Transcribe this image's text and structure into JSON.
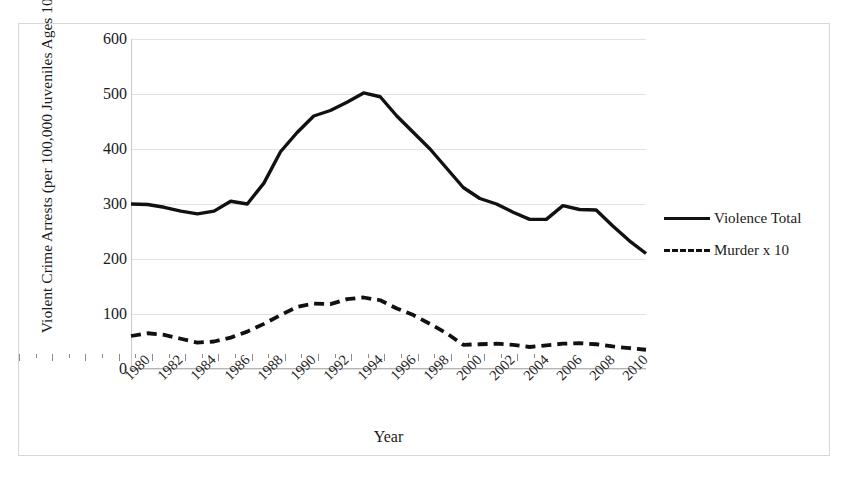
{
  "chart_data": {
    "type": "line",
    "title": "",
    "xlabel": "Year",
    "ylabel": "Violent Crime Arrests (per 100,000 Juveniles Ages 10–17)",
    "x": [
      1980,
      1981,
      1982,
      1983,
      1984,
      1985,
      1986,
      1987,
      1988,
      1989,
      1990,
      1991,
      1992,
      1993,
      1994,
      1995,
      1996,
      1997,
      1998,
      1999,
      2000,
      2001,
      2002,
      2003,
      2004,
      2005,
      2006,
      2007,
      2008,
      2009,
      2010,
      2011
    ],
    "xlim": [
      1980,
      2011
    ],
    "ylim": [
      0,
      600
    ],
    "yticks": [
      0,
      100,
      200,
      300,
      400,
      500,
      600
    ],
    "xtick_labels": [
      "1980",
      "1982",
      "1984",
      "1986",
      "1988",
      "1990",
      "1992",
      "1994",
      "1996",
      "1998",
      "2000",
      "2002",
      "2004",
      "2006",
      "2008",
      "2010"
    ],
    "grid": true,
    "legend_position": "right",
    "series": [
      {
        "name": "Violence Total",
        "style": "solid",
        "color": "#111111",
        "values": [
          300,
          299,
          294,
          287,
          282,
          287,
          305,
          300,
          338,
          395,
          430,
          460,
          470,
          485,
          502,
          495,
          460,
          430,
          400,
          365,
          330,
          310,
          300,
          285,
          272,
          272,
          297,
          290,
          289,
          260,
          233,
          210
        ]
      },
      {
        "name": "Murder x 10",
        "style": "dashed",
        "color": "#111111",
        "values": [
          60,
          65,
          62,
          55,
          48,
          50,
          57,
          68,
          82,
          98,
          113,
          119,
          118,
          127,
          130,
          125,
          110,
          98,
          82,
          65,
          44,
          45,
          46,
          44,
          40,
          43,
          46,
          47,
          45,
          41,
          38,
          35
        ]
      }
    ]
  },
  "legend": {
    "items": [
      {
        "label": "Violence Total"
      },
      {
        "label": "Murder x 10"
      }
    ]
  },
  "axis": {
    "y_title": "Violent Crime Arrests (per 100,000 Juveniles Ages 10–17)",
    "x_title": "Year"
  }
}
